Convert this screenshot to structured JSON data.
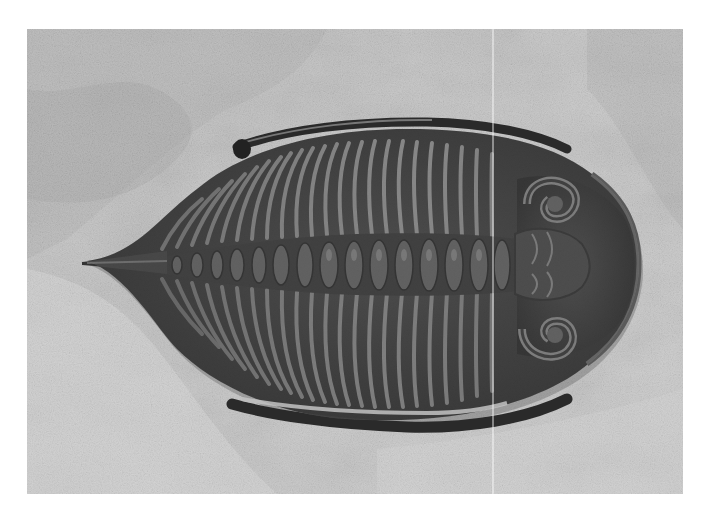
{
  "image": {
    "subject": "Trilobite fossil on limestone matrix",
    "description": "Grayscale photograph of a dark trilobite fossil (head pointing right, pygidium spine pointing left) embedded in pale textured rock",
    "frame": {
      "x": 27,
      "y": 29,
      "width": 656,
      "height": 465
    },
    "colors": {
      "page_background": "#ffffff",
      "rock_light": "#d8d8d8",
      "rock_mid": "#b4b4b4",
      "rock_dark": "#8a8a8a",
      "fossil_dark": "#2a2a2a",
      "fossil_mid": "#4a4a4a",
      "fossil_highlight": "#8c8c8c"
    },
    "features": {
      "cephalon": "rounded head shield with curled eye lobes, right side",
      "thorax": "segmented axial lobe with ribbed pleurae",
      "genal_spines": "long curved spines along top and bottom edges",
      "pygidium": "pointed tail spine, left side",
      "scan_line": "faint vertical white line near x=493"
    }
  }
}
